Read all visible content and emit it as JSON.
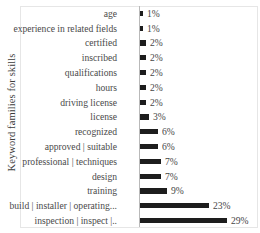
{
  "chart_data": {
    "type": "bar",
    "orientation": "horizontal",
    "title": "",
    "xlabel": "",
    "ylabel": "Keyword families for skills",
    "xlim": [
      0,
      31
    ],
    "grid": false,
    "legend": null,
    "units": "%",
    "bar_color": "#1d1d1d",
    "categories": [
      "age",
      "experience in related fields",
      "certified",
      "inscribed",
      "qualifications",
      "hours",
      "driving license",
      "license",
      "recognized",
      "approved | suitable",
      "professional | techniques",
      "design",
      "training",
      "build | installer | operating...",
      "inspection | inspect |.."
    ],
    "values": [
      1,
      1,
      2,
      2,
      2,
      2,
      2,
      3,
      6,
      6,
      7,
      7,
      9,
      23,
      29
    ],
    "data_labels": [
      "1%",
      "1%",
      "2%",
      "2%",
      "2%",
      "2%",
      "2%",
      "3%",
      "6%",
      "6%",
      "7%",
      "7%",
      "9%",
      "23%",
      "29%"
    ]
  },
  "axis": {
    "y_title": "Keyword families for skills"
  }
}
